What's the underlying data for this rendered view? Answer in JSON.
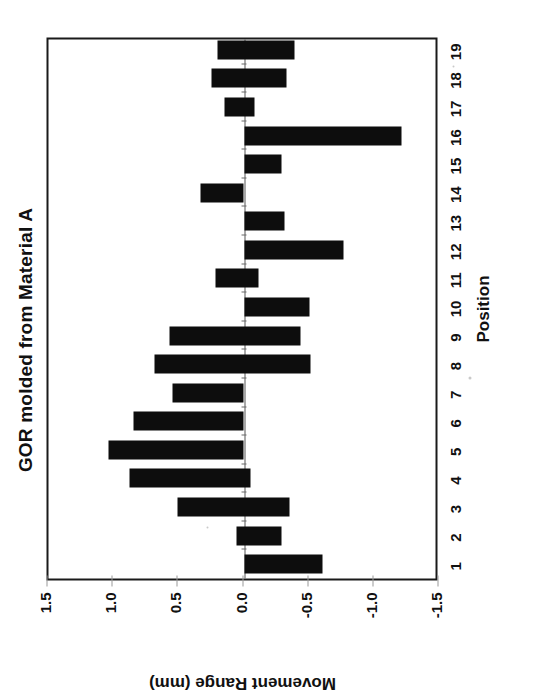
{
  "figure": {
    "title": "GOR molded from Material A",
    "background_color": "#ffffff",
    "bar_color": "#0d0d0d",
    "axis_color": "#1a1a1a"
  },
  "chart_data": {
    "type": "bar",
    "orientation": "vertical-floating-range",
    "title": "GOR molded from Material A",
    "xlabel": "Position",
    "ylabel": "Movement Range (mm)",
    "categories": [
      "1",
      "2",
      "3",
      "4",
      "5",
      "6",
      "7",
      "8",
      "9",
      "10",
      "11",
      "12",
      "13",
      "14",
      "15",
      "16",
      "17",
      "18",
      "19"
    ],
    "ytick_labels": [
      "1.5",
      "1.0",
      "0.5",
      "0.0",
      "-0.5",
      "-1.0",
      "-1.5"
    ],
    "ytick_values": [
      1.5,
      1.0,
      0.5,
      0.0,
      -0.5,
      -1.0,
      -1.5
    ],
    "ylim": [
      -1.5,
      1.5
    ],
    "grid": false,
    "legend": null,
    "series": [
      {
        "name": "Movement Range (mm)",
        "low": [
          -0.6,
          -0.29,
          -0.35,
          -0.05,
          0.0,
          0.0,
          0.0,
          -0.51,
          -0.43,
          -0.5,
          -0.11,
          -0.76,
          -0.31,
          0.0,
          -0.29,
          -1.21,
          -0.08,
          -0.33,
          -0.39
        ],
        "high": [
          0.0,
          0.06,
          0.51,
          0.88,
          1.04,
          0.85,
          0.55,
          0.69,
          0.57,
          0.0,
          0.22,
          0.0,
          0.0,
          0.33,
          0.0,
          0.0,
          0.15,
          0.25,
          0.2
        ]
      }
    ]
  }
}
